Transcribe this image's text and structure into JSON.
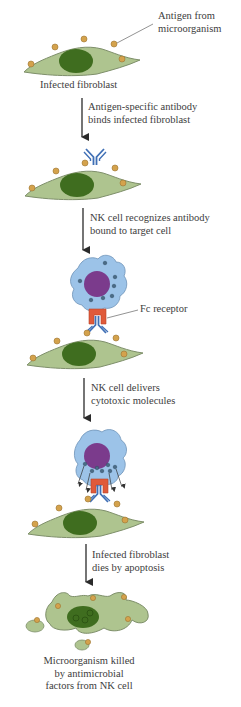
{
  "colors": {
    "fibroblast_fill": "#aec48f",
    "fibroblast_stroke": "#7e8f6a",
    "nucleus": "#3f6d1f",
    "antigen": "#d4a24c",
    "antibody": "#3f6fb5",
    "nk_cell_fill": "#9cc3e8",
    "nk_nucleus": "#7b3b8c",
    "granule": "#4a6b86",
    "fc_receptor": "#e05a3a",
    "arrow": "#2a2a2a"
  },
  "labels": {
    "antigen_callout": [
      "Antigen from",
      "microorganism"
    ],
    "infected_fibroblast": "Infected fibroblast",
    "step1": [
      "Antigen-specific antibody",
      "binds infected fibroblast"
    ],
    "step2": [
      "NK cell recognizes antibody",
      "bound to target cell"
    ],
    "fc_receptor_callout": "Fc receptor",
    "step3": [
      "NK cell delivers",
      "cytotoxic molecules"
    ],
    "step4": [
      "Infected fibroblast",
      "dies by apoptosis"
    ],
    "final": [
      "Microorganism killed",
      "by antimicrobial",
      "factors from NK cell"
    ]
  }
}
